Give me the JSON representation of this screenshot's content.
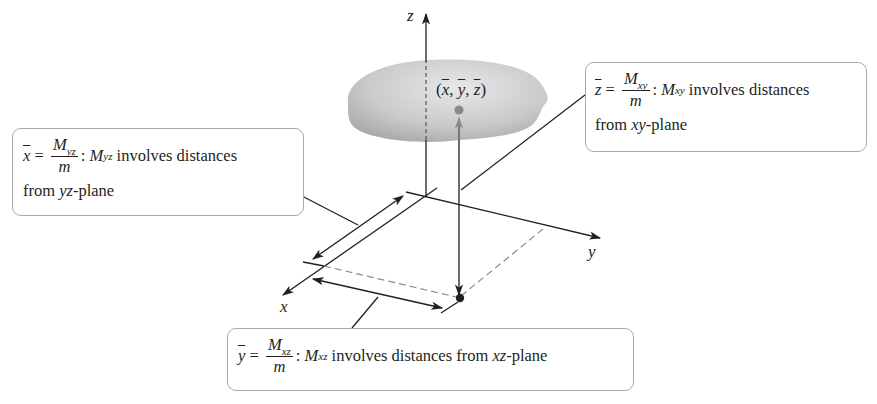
{
  "figure": {
    "axes": {
      "x_label": "x",
      "y_label": "y",
      "z_label": "z"
    },
    "center_of_mass_label": {
      "open": "(",
      "x": "x",
      "sep1": ", ",
      "y": "y",
      "sep2": ", ",
      "z": "z",
      "close": ")"
    },
    "colors": {
      "line": "#231f20",
      "solid_fill": "#bcbec0",
      "centroid_dot": "#8a8a8a",
      "dashed": "#8d8d8d",
      "box_border": "#a7a9ac"
    }
  },
  "callouts": {
    "x_bar": {
      "var": "x",
      "eq": " = ",
      "num": "M",
      "num_sub": "yz",
      "den": "m",
      "colon": ": ",
      "moment": "M",
      "moment_sub": "yz",
      "text1": " involves distances",
      "text2_pre": "from ",
      "plane": "yz",
      "text2_post": "-plane"
    },
    "z_bar": {
      "var": "z",
      "eq": " = ",
      "num": "M",
      "num_sub": "xy",
      "den": "m",
      "colon": ": ",
      "moment": "M",
      "moment_sub": "xy",
      "text1": " involves distances",
      "text2_pre": "from ",
      "plane": "xy",
      "text2_post": "-plane"
    },
    "y_bar": {
      "var": "y",
      "eq": " = ",
      "num": "M",
      "num_sub": "xz",
      "den": "m",
      "colon": ": ",
      "moment": "M",
      "moment_sub": "xz",
      "text1": " involves distances from ",
      "plane": "xz",
      "text2_post": "-plane"
    }
  }
}
